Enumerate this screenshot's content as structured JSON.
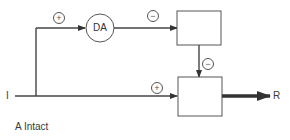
{
  "diagram": {
    "nodes": {
      "da": {
        "label": "DA"
      },
      "top_box": {
        "label": ""
      },
      "bottom_box": {
        "label": ""
      }
    },
    "input_label": "I",
    "output_label": "R",
    "signs": {
      "input_to_da": "+",
      "da_to_top_box": "−",
      "top_box_to_bottom_box": "−",
      "input_to_bottom_box": "+"
    },
    "caption": "A Intact"
  }
}
